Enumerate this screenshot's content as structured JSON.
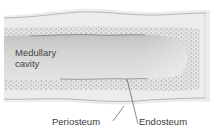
{
  "diagram": {
    "labels": {
      "medullary_cavity": "Medullary cavity",
      "periosteum": "Periosteum",
      "endosteum": "Endosteum"
    },
    "colors": {
      "background": "#ffffff",
      "periosteum_band": "#e9e9e9",
      "compact_bone_dots": "#bdbdbd",
      "medullary_cavity": "#cfcfcf",
      "label_text": "#3a3a3a",
      "leader_lines": "#555555"
    }
  }
}
